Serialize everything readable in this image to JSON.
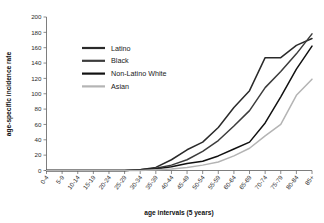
{
  "chart_data": {
    "type": "line",
    "title": "",
    "xlabel": "age intervals (5 years)",
    "ylabel": "age-specific incidence rate",
    "ylim": [
      0,
      200
    ],
    "yticks": [
      0,
      20,
      40,
      60,
      80,
      100,
      120,
      140,
      160,
      180,
      200
    ],
    "grid": false,
    "legend_position": "upper-left-inside",
    "categories": [
      "0-4",
      "5-9",
      "10-14",
      "15-19",
      "20-24",
      "25-29",
      "30-34",
      "35-39",
      "40-44",
      "45-49",
      "50-54",
      "55-59",
      "60-64",
      "65-69",
      "70-74",
      "75-79",
      "80-84",
      "85+"
    ],
    "series": [
      {
        "name": "Latino",
        "color": "#2a2a2a",
        "values": [
          0,
          0,
          0,
          0,
          0,
          0,
          1,
          4,
          14,
          27,
          37,
          56,
          82,
          104,
          147,
          147,
          163,
          172
        ]
      },
      {
        "name": "Black",
        "color": "#3c3c3c",
        "values": [
          0,
          0,
          0,
          0,
          0,
          0,
          1,
          3,
          7,
          14,
          25,
          39,
          58,
          78,
          108,
          129,
          152,
          178
        ]
      },
      {
        "name": "Non-Latino White",
        "color": "#111111",
        "values": [
          0,
          0,
          0,
          0,
          0,
          0,
          1,
          2,
          5,
          9,
          12,
          19,
          28,
          37,
          62,
          96,
          132,
          162
        ]
      },
      {
        "name": "Asian",
        "color": "#b4b4b4",
        "values": [
          0,
          0,
          0,
          0,
          0,
          0,
          0,
          1,
          2,
          4,
          7,
          11,
          19,
          29,
          45,
          60,
          98,
          119
        ]
      }
    ]
  }
}
